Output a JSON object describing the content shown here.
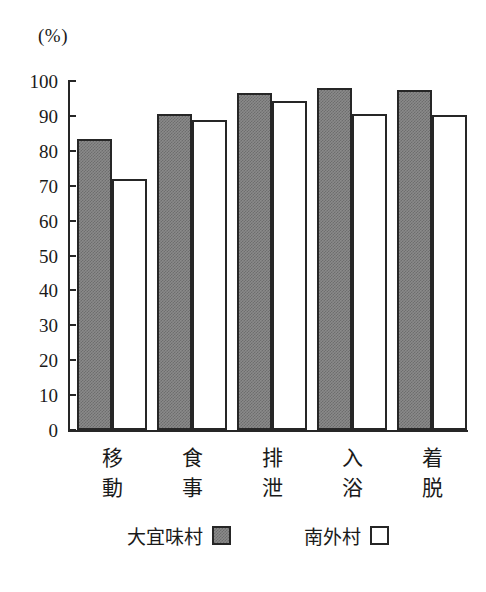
{
  "chart_data": {
    "type": "bar",
    "title": "",
    "subtitle": "",
    "unit_label": "(%)",
    "xlabel": "",
    "ylabel": "",
    "ylim": [
      0,
      100
    ],
    "ytick_labels": [
      "100",
      "90",
      "80",
      "70",
      "60",
      "50",
      "40",
      "30",
      "20",
      "10",
      "0"
    ],
    "ytick_values": [
      100,
      90,
      80,
      70,
      60,
      50,
      40,
      30,
      20,
      10,
      0
    ],
    "grid": false,
    "legend_position": "bottom",
    "categories": [
      "移動",
      "食事",
      "排泄",
      "入浴",
      "着脱"
    ],
    "category_lines": [
      [
        "移",
        "動"
      ],
      [
        "食",
        "事"
      ],
      [
        "排",
        "泄"
      ],
      [
        "入",
        "浴"
      ],
      [
        "着",
        "脱"
      ]
    ],
    "series": [
      {
        "name": "大宜味村",
        "fill": "gray-dither",
        "color": "#8a8a8a",
        "values": [
          83.5,
          90.5,
          96.5,
          98.0,
          97.5
        ]
      },
      {
        "name": "南外村",
        "fill": "white",
        "color": "#ffffff",
        "values": [
          71.8,
          88.8,
          94.3,
          90.5,
          90.3
        ]
      }
    ],
    "axis_color": "#262626",
    "background": "#ffffff"
  }
}
